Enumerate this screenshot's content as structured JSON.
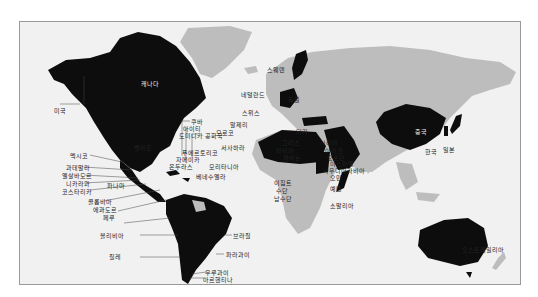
{
  "map": {
    "colors": {
      "highlight": "#0d0d0d",
      "other_land": "#bdbdbd",
      "ocean": "#f1f1f1",
      "border": "#9a9a9a"
    },
    "labels": {
      "canada": "캐나다",
      "usa": "미국",
      "mexico": "멕시코",
      "guatemala": "과테말라",
      "el_salvador": "엘살바도르",
      "nicaragua": "니카라과",
      "costa_rica": "코스타리카",
      "panama": "파나마",
      "colombia": "콜롬비아",
      "ecuador": "에콰도르",
      "peru": "페루",
      "bolivia": "볼리비아",
      "chile": "칠레",
      "cuba": "쿠바",
      "haiti": "아이티",
      "dominican_republic": "도미니카 공화국",
      "puerto_rico": "푸에르토리코",
      "jamaica": "자메이카",
      "honduras": "온두라스",
      "belize": "벨리즈",
      "venezuela": "베네수엘라",
      "brazil": "브라질",
      "paraguay": "파라과이",
      "uruguay": "우루과이",
      "argentina": "아르헨티나",
      "sweden": "스웨덴",
      "netherlands": "네덜란드",
      "germany": "독일",
      "switzerland": "스위스",
      "algeria": "알제리",
      "morocco": "모로코",
      "western_sahara": "서사하라",
      "mauritania": "모리타니아",
      "greece": "그리스",
      "turkey": "터키",
      "libya": "리비아",
      "lebanon": "레바논",
      "syria": "시리아",
      "iraq": "이라크",
      "jordan": "요르단",
      "israel": "이스라엘",
      "saudi_arabia": "사우디아라비아",
      "oman": "오만",
      "yemen": "예멘",
      "egypt": "이집트",
      "sudan": "수단",
      "south_sudan": "남수단",
      "somalia": "소말리아",
      "china": "중국",
      "korea": "한국",
      "japan": "일본",
      "australia": "오스트레일리아"
    }
  }
}
